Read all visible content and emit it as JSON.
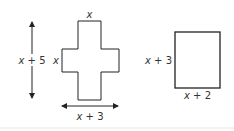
{
  "figure": {
    "cross": {
      "top_label_var": "x",
      "side_label_var": "x",
      "height_label": {
        "var": "x",
        "op": " + ",
        "num": "5"
      },
      "width_label": {
        "var": "x",
        "op": " + ",
        "num": "3"
      }
    },
    "rectangle": {
      "height_label": {
        "var": "x",
        "op": " + ",
        "num": "3"
      },
      "width_label": {
        "var": "x",
        "op": " + ",
        "num": "2"
      }
    },
    "colors": {
      "stroke": "#222222",
      "text": "#333333",
      "divider": "#e6e6e6"
    }
  }
}
